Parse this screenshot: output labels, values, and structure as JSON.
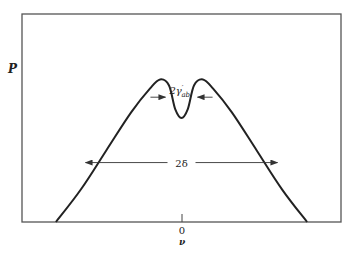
{
  "chart_data": {
    "type": "line",
    "title": "",
    "ylabel": "P",
    "xlabel": "ν",
    "x_tick_labels": [
      "0"
    ],
    "series": [
      {
        "name": "P(ν)",
        "x": [
          -1.0,
          -0.8,
          -0.6,
          -0.4,
          -0.25,
          -0.17,
          -0.1,
          -0.05,
          0.0,
          0.05,
          0.1,
          0.17,
          0.25,
          0.4,
          0.6,
          0.8,
          1.0
        ],
        "y": [
          0.0,
          0.22,
          0.48,
          0.74,
          0.9,
          0.96,
          0.92,
          0.76,
          0.7,
          0.76,
          0.92,
          0.96,
          0.9,
          0.74,
          0.48,
          0.22,
          0.0
        ]
      }
    ],
    "xlim": [
      -1.27,
      1.27
    ],
    "ylim": [
      0,
      1.4
    ],
    "annotations": [
      {
        "text": "2γ′ab",
        "main": "2γ",
        "sup": "′",
        "sub": "ab",
        "type": "inward-arrows-width",
        "at_y": 0.84
      },
      {
        "text": "2δ",
        "type": "double-arrow-width",
        "at_y": 0.4
      }
    ],
    "grid": false
  }
}
